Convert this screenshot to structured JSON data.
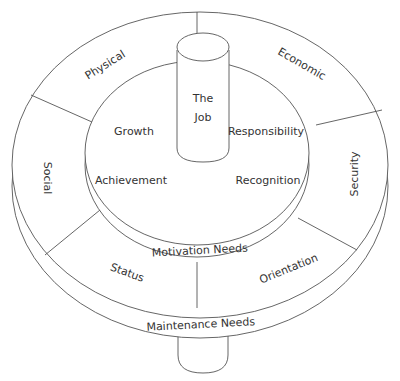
{
  "diagram": {
    "type": "concentric-ring-model",
    "colors": {
      "stroke": "#555555",
      "text": "#333333",
      "background": "#ffffff"
    },
    "core": {
      "label_line1": "The",
      "label_line2": "Job"
    },
    "inner_ring": {
      "band_label": "Motivation Needs",
      "segments": [
        "Growth",
        "Responsibility",
        "Achievement",
        "Recognition"
      ]
    },
    "outer_ring": {
      "band_label": "Maintenance Needs",
      "segments": [
        "Physical",
        "Economic",
        "Social",
        "Security",
        "Status",
        "Orientation"
      ]
    }
  }
}
